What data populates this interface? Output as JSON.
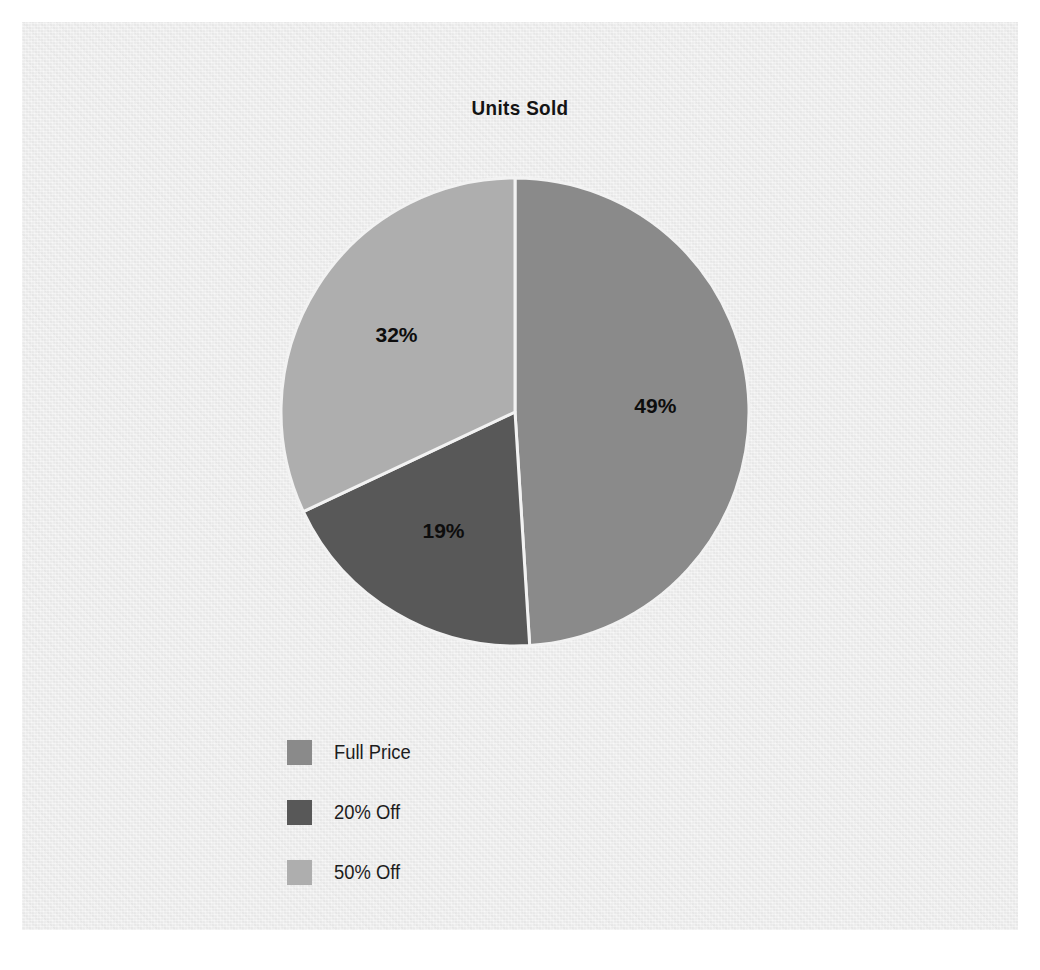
{
  "chart_data": {
    "type": "pie",
    "title": "Units Sold",
    "xlabel": "",
    "ylabel": "",
    "categories": [
      "Full Price",
      "20% Off",
      "50% Off"
    ],
    "values": [
      49,
      19,
      32
    ],
    "value_labels": [
      "49%",
      "19%",
      "32%"
    ],
    "units": "percent",
    "start_angle_deg": 90,
    "direction": "clockwise",
    "legend_position": "bottom-left",
    "grid": false,
    "slice_colors": [
      "#8a8a8a",
      "#585858",
      "#aeaeae"
    ],
    "slice_divider_color": "#f2f2f2",
    "label_color": "#0d0d0d",
    "background_color": "#ededed",
    "page_color": "#ffffff",
    "series": [
      {
        "name": "Units Sold",
        "slices": [
          {
            "label": "Full Price",
            "value": 49,
            "display": "49%",
            "color": "#8a8a8a"
          },
          {
            "label": "20% Off",
            "value": 19,
            "display": "19%",
            "color": "#585858"
          },
          {
            "label": "50% Off",
            "value": 32,
            "display": "32%",
            "color": "#aeaeae"
          }
        ]
      }
    ]
  },
  "chart": {
    "title": "Units Sold"
  },
  "legend": {
    "items": [
      {
        "label": "Full Price",
        "color": "#8a8a8a"
      },
      {
        "label": "20% Off",
        "color": "#585858"
      },
      {
        "label": "50% Off",
        "color": "#aeaeae"
      }
    ]
  },
  "labels": {
    "slice_0": "49%",
    "slice_1": "19%",
    "slice_2": "32%"
  }
}
